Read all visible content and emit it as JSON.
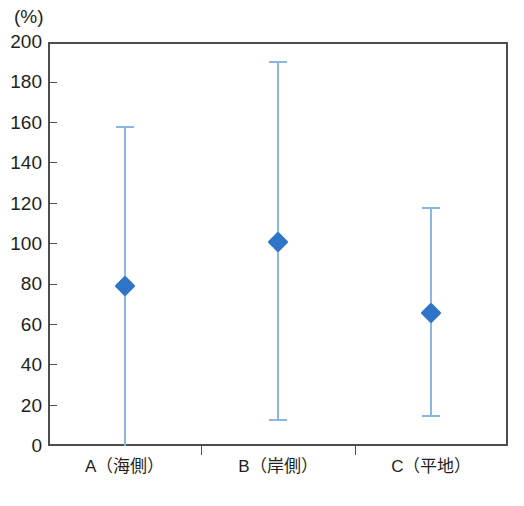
{
  "chart_data": {
    "type": "scatter",
    "title": "",
    "subtitle": "",
    "xlabel": "",
    "ylabel": "",
    "unit_label": "(%)",
    "categories": [
      "A（海側）",
      "B（岸側）",
      "C（平地）"
    ],
    "values": [
      79,
      101,
      66
    ],
    "error_low": [
      0,
      13,
      15
    ],
    "error_high": [
      158,
      190,
      118
    ],
    "series": [
      {
        "name": "median with range",
        "points": [
          {
            "category": "A（海側）",
            "value": 79,
            "low": 0,
            "high": 158
          },
          {
            "category": "B（岸側）",
            "value": 101,
            "low": 13,
            "high": 190
          },
          {
            "category": "C（平地）",
            "value": 66,
            "low": 15,
            "high": 118
          }
        ]
      }
    ],
    "ylim": [
      0,
      200
    ],
    "ytick_step": 20,
    "yticks": [
      0,
      20,
      40,
      60,
      80,
      100,
      120,
      140,
      160,
      180,
      200
    ],
    "ytick_labels": [
      "0",
      "20",
      "40",
      "60",
      "80",
      "100",
      "120",
      "140",
      "160",
      "180",
      "200"
    ],
    "grid": false,
    "legend": "none",
    "marker_shape": "diamond",
    "colors": {
      "marker": "#2e75c8",
      "errorbar": "#8ab6e3",
      "axis": "#4d4d4d",
      "text": "#231f20",
      "background": "#ffffff"
    }
  }
}
